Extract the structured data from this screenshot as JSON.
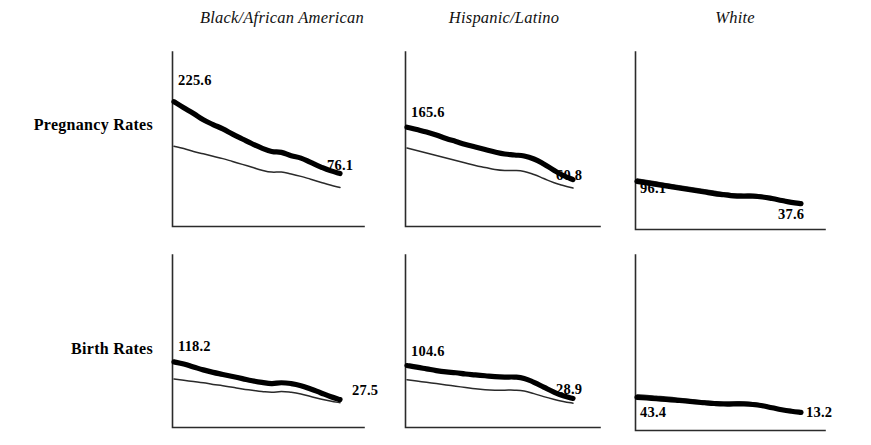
{
  "figure": {
    "row_labels": [
      "Pregnancy Rates",
      "Birth Rates"
    ],
    "column_headers": [
      "Black/African American",
      "Hispanic/Latino",
      "White"
    ]
  },
  "chart_data": {
    "type": "line",
    "title": "",
    "xlabel": "",
    "ylabel": "",
    "grid": false,
    "legend": "none",
    "layout": {
      "rows": [
        "Pregnancy Rates",
        "Birth Rates"
      ],
      "columns": [
        "Black/African American",
        "Hispanic/Latino",
        "White"
      ]
    },
    "series_names": [
      "thick-line",
      "thin-line"
    ],
    "panels": [
      {
        "row": "Pregnancy Rates",
        "column": "Black/African American",
        "start_label": "225.6",
        "end_label": "76.1",
        "series": [
          {
            "name": "thick-line",
            "values": [
              225.6,
              213.0,
              201.0,
              188.0,
              178.0,
              169.0,
              158.0,
              148.0,
              138.0,
              129.0,
              122.0,
              120.0,
              113.0,
              108.0,
              99.0,
              90.0,
              82.0,
              76.1
            ]
          },
          {
            "name": "thin-line",
            "values": [
              133.0,
              128.0,
              122.0,
              117.0,
              112.0,
              107.0,
              101.0,
              95.0,
              89.0,
              83.0,
              79.0,
              79.0,
              75.0,
              70.0,
              64.0,
              58.0,
              52.0,
              47.0
            ]
          }
        ]
      },
      {
        "row": "Pregnancy Rates",
        "column": "Hispanic/Latino",
        "start_label": "165.6",
        "end_label": "60.8",
        "series": [
          {
            "name": "thick-line",
            "values": [
              165.6,
              161.0,
              156.0,
              150.0,
              143.0,
              137.0,
              131.0,
              126.0,
              121.0,
              116.0,
              112.0,
              110.0,
              108.0,
              102.0,
              92.0,
              80.0,
              69.0,
              60.8
            ]
          },
          {
            "name": "thin-line",
            "values": [
              124.0,
              119.0,
              114.0,
              109.0,
              104.0,
              99.0,
              94.0,
              89.0,
              85.0,
              81.0,
              79.0,
              79.0,
              77.0,
              71.0,
              63.0,
              55.0,
              49.0,
              44.0
            ]
          }
        ]
      },
      {
        "row": "Pregnancy Rates",
        "column": "White",
        "start_label": "96.1",
        "end_label": "37.6",
        "series": [
          {
            "name": "thick-line",
            "values": [
              96.1,
              92.0,
              88.0,
              84.0,
              80.0,
              76.0,
              72.0,
              68.0,
              64.0,
              61.0,
              58.0,
              57.0,
              57.0,
              55.0,
              51.0,
              46.0,
              41.0,
              37.6
            ]
          },
          {
            "name": "thin-line",
            "values": [
              102.0,
              98.0,
              94.0,
              90.0,
              86.0,
              82.0,
              78.0,
              74.0,
              70.0,
              66.0,
              63.0,
              62.0,
              62.0,
              59.0,
              54.0,
              48.0,
              43.0,
              38.5
            ]
          }
        ]
      },
      {
        "row": "Birth Rates",
        "column": "Black/African American",
        "start_label": "118.2",
        "end_label": "27.5",
        "series": [
          {
            "name": "thick-line",
            "values": [
              118.2,
              113.0,
              106.0,
              99.0,
              93.0,
              88.0,
              83.0,
              78.0,
              73.0,
              69.0,
              66.0,
              68.0,
              66.0,
              61.0,
              53.0,
              44.0,
              35.0,
              27.5
            ]
          },
          {
            "name": "thin-line",
            "values": [
              77.0,
              74.0,
              71.0,
              68.0,
              64.0,
              61.0,
              57.0,
              53.0,
              50.0,
              47.0,
              45.0,
              47.0,
              45.0,
              41.0,
              35.0,
              29.0,
              24.0,
              20.0
            ]
          }
        ]
      },
      {
        "row": "Birth Rates",
        "column": "Hispanic/Latino",
        "start_label": "104.6",
        "end_label": "28.9",
        "series": [
          {
            "name": "thick-line",
            "values": [
              104.6,
              101.0,
              97.0,
              93.0,
              90.0,
              88.0,
              85.0,
              83.0,
              81.0,
              79.0,
              78.0,
              78.0,
              75.0,
              66.0,
              55.0,
              44.0,
              35.0,
              28.9
            ]
          },
          {
            "name": "thin-line",
            "values": [
              72.0,
              69.0,
              66.0,
              63.0,
              60.0,
              57.0,
              54.0,
              51.0,
              49.0,
              48.0,
              48.0,
              48.0,
              46.0,
              40.0,
              33.0,
              27.0,
              22.0,
              18.0
            ]
          }
        ]
      },
      {
        "row": "Birth Rates",
        "column": "White",
        "start_label": "43.4",
        "end_label": "13.2",
        "series": [
          {
            "name": "thick-line",
            "values": [
              43.4,
              42.0,
              40.5,
              39.0,
              37.5,
              36.0,
              34.0,
              32.5,
              31.0,
              30.0,
              30.0,
              30.0,
              29.0,
              26.5,
              22.5,
              18.5,
              15.5,
              13.2
            ]
          },
          {
            "name": "thin-line",
            "values": [
              48.0,
              47.0,
              45.5,
              44.0,
              42.0,
              40.0,
              38.0,
              36.0,
              34.5,
              33.5,
              34.0,
              34.0,
              32.5,
              29.0,
              24.5,
              20.0,
              16.5,
              13.8
            ]
          }
        ]
      }
    ]
  },
  "labels": {
    "p00_start": "225.6",
    "p00_end": "76.1",
    "p01_start": "165.6",
    "p01_end": "60.8",
    "p02_start": "96.1",
    "p02_end": "37.6",
    "p10_start": "118.2",
    "p10_end": "27.5",
    "p11_start": "104.6",
    "p11_end": "28.9",
    "p12_start": "43.4",
    "p12_end": "13.2"
  },
  "colors": {
    "ink": "#000000",
    "axis": "#2b2b2b",
    "background": "#ffffff"
  }
}
